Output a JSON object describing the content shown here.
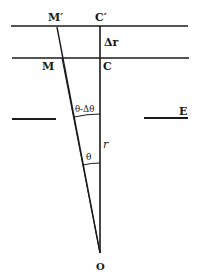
{
  "diagram": {
    "labels": {
      "m_prime": "M′",
      "c_prime": "C′",
      "delta_r": "Δr",
      "m": "M",
      "c": "C",
      "theta_minus_delta_theta": "θ-Δθ",
      "e": "E",
      "r": "r",
      "theta": "θ",
      "o": "O"
    },
    "colors": {
      "ink": "#1a1a1a",
      "background": "#ffffff"
    }
  }
}
